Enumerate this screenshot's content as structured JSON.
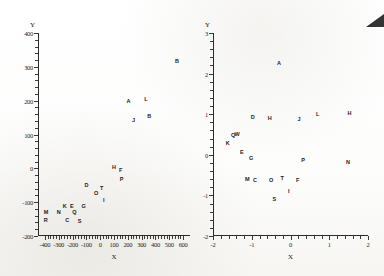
{
  "figure": {
    "background_color": "#fbfbfa",
    "ink_color": "#1c1c1c",
    "corner_artifact": "dark-triangle-top-right"
  },
  "chart_data": [
    {
      "type": "scatter",
      "panel": "left",
      "title": "",
      "xlabel": "X",
      "ylabel": "Y",
      "xlim": [
        -450,
        650
      ],
      "ylim": [
        -200,
        400
      ],
      "xticks": [
        -400,
        -300,
        -200,
        -100,
        0,
        100,
        200,
        300,
        400,
        500,
        600
      ],
      "xtick_labels": [
        "-400",
        "-300",
        "-200",
        "-100",
        "0",
        "100",
        "200",
        "300",
        "400",
        "500",
        "600"
      ],
      "yticks": [
        -200,
        -100,
        0,
        100,
        200,
        300,
        400
      ],
      "ytick_labels": [
        "-200",
        "-100",
        "0",
        "100",
        "200",
        "300",
        "400"
      ],
      "grid": false,
      "legend": "none",
      "marker_style": "letter-label",
      "points": [
        {
          "label": "R",
          "x": -395,
          "y": -152
        },
        {
          "label": "M",
          "x": -392,
          "y": -130
        },
        {
          "label": "N",
          "x": -300,
          "y": -128
        },
        {
          "label": "K",
          "x": -258,
          "y": -112
        },
        {
          "label": "C",
          "x": -240,
          "y": -152
        },
        {
          "label": "E",
          "x": -205,
          "y": -110
        },
        {
          "label": "Q",
          "x": -188,
          "y": -130
        },
        {
          "label": "S",
          "x": -150,
          "y": -155
        },
        {
          "label": "G",
          "x": -120,
          "y": -112
        },
        {
          "label": "D",
          "x": -100,
          "y": -48
        },
        {
          "label": "O",
          "x": -30,
          "y": -72
        },
        {
          "label": "T",
          "x": 10,
          "y": -58
        },
        {
          "label": "I",
          "x": 25,
          "y": -95
        },
        {
          "label": "H",
          "x": 100,
          "y": 5
        },
        {
          "label": "F",
          "x": 148,
          "y": -5
        },
        {
          "label": "P",
          "x": 155,
          "y": -32
        },
        {
          "label": "A",
          "x": 205,
          "y": 198
        },
        {
          "label": "J",
          "x": 240,
          "y": 143
        },
        {
          "label": "L",
          "x": 330,
          "y": 205
        },
        {
          "label": "B",
          "x": 355,
          "y": 155
        },
        {
          "label": "B",
          "x": 555,
          "y": 318
        }
      ]
    },
    {
      "type": "scatter",
      "panel": "right",
      "title": "",
      "xlabel": "X",
      "ylabel": "Y",
      "xlim": [
        -2,
        2
      ],
      "ylim": [
        -2,
        3
      ],
      "xticks": [
        -2,
        -1,
        0,
        1,
        2
      ],
      "xtick_labels": [
        "-2",
        "-1",
        "0",
        "1",
        "2"
      ],
      "yticks": [
        -2,
        -1,
        0,
        1,
        2,
        3
      ],
      "ytick_labels": [
        "-2",
        "-1",
        "0",
        "1",
        "2",
        "3"
      ],
      "grid": false,
      "legend": "none",
      "marker_style": "letter-label",
      "points": [
        {
          "label": "A",
          "x": -0.3,
          "y": 2.25
        },
        {
          "label": "H",
          "x": 1.52,
          "y": 1.02
        },
        {
          "label": "D",
          "x": -0.98,
          "y": 0.92
        },
        {
          "label": "H",
          "x": -0.54,
          "y": 0.9
        },
        {
          "label": "J",
          "x": 0.22,
          "y": 0.88
        },
        {
          "label": "L",
          "x": 0.7,
          "y": 1.0
        },
        {
          "label": "Q",
          "x": -1.48,
          "y": 0.5
        },
        {
          "label": "W",
          "x": -1.38,
          "y": 0.52
        },
        {
          "label": "K",
          "x": -1.62,
          "y": 0.28
        },
        {
          "label": "E",
          "x": -1.26,
          "y": 0.08
        },
        {
          "label": "G",
          "x": -1.02,
          "y": -0.08
        },
        {
          "label": "P",
          "x": 0.32,
          "y": -0.12
        },
        {
          "label": "N",
          "x": 1.48,
          "y": -0.18
        },
        {
          "label": "M",
          "x": -1.12,
          "y": -0.6
        },
        {
          "label": "C",
          "x": -0.92,
          "y": -0.62
        },
        {
          "label": "O",
          "x": -0.5,
          "y": -0.62
        },
        {
          "label": "T",
          "x": -0.22,
          "y": -0.58
        },
        {
          "label": "F",
          "x": 0.18,
          "y": -0.62
        },
        {
          "label": "I",
          "x": -0.05,
          "y": -0.9
        },
        {
          "label": "S",
          "x": -0.42,
          "y": -1.08
        }
      ]
    }
  ]
}
